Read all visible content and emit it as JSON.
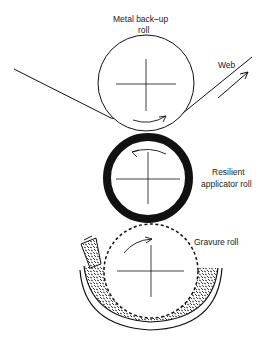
{
  "diagram": {
    "labels": {
      "backup_roll_line1": "Metal back–up",
      "backup_roll_line2": "roll",
      "web": "Web",
      "applicator_line1": "Resilient",
      "applicator_line2": "applicator roll",
      "gravure": "Gravure roll"
    },
    "components": [
      {
        "name": "metal-back-up-roll",
        "rotation": "clockwise"
      },
      {
        "name": "resilient-applicator-roll",
        "rotation": "counterclockwise"
      },
      {
        "name": "gravure-roll",
        "rotation": "clockwise"
      },
      {
        "name": "web",
        "direction": "up-right"
      },
      {
        "name": "coating-pan"
      },
      {
        "name": "doctor-blade"
      }
    ],
    "colors": {
      "ink": "#111111",
      "background": "#ffffff"
    }
  }
}
